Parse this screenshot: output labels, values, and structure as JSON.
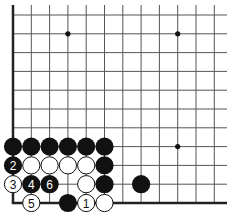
{
  "diagram": {
    "type": "go-board-fragment",
    "corner": "bottom-left",
    "grid": {
      "origin_x": 13,
      "origin_y": 15,
      "spacing_x": 18.3,
      "spacing_y": 18.8,
      "cols": 12,
      "rows": 11,
      "line_extend_right": 227,
      "line_extend_top": 5
    },
    "colors": {
      "black": "#111111",
      "white": "#ffffff",
      "line": "#555555",
      "edge": "#222222"
    },
    "star_points": [
      {
        "col": 3,
        "row": 1
      },
      {
        "col": 9,
        "row": 1
      },
      {
        "col": 9,
        "row": 7
      }
    ],
    "stones": [
      {
        "col": 0,
        "row": 7,
        "color": "black",
        "label": ""
      },
      {
        "col": 1,
        "row": 7,
        "color": "black",
        "label": ""
      },
      {
        "col": 2,
        "row": 7,
        "color": "black",
        "label": ""
      },
      {
        "col": 3,
        "row": 7,
        "color": "black",
        "label": ""
      },
      {
        "col": 4,
        "row": 7,
        "color": "black",
        "label": ""
      },
      {
        "col": 5,
        "row": 7,
        "color": "black",
        "label": ""
      },
      {
        "col": 0,
        "row": 8,
        "color": "black",
        "label": "2"
      },
      {
        "col": 1,
        "row": 8,
        "color": "white",
        "label": ""
      },
      {
        "col": 2,
        "row": 8,
        "color": "white",
        "label": ""
      },
      {
        "col": 3,
        "row": 8,
        "color": "white",
        "label": ""
      },
      {
        "col": 4,
        "row": 8,
        "color": "white",
        "label": ""
      },
      {
        "col": 5,
        "row": 8,
        "color": "black",
        "label": ""
      },
      {
        "col": 0,
        "row": 9,
        "color": "white",
        "label": "3"
      },
      {
        "col": 1,
        "row": 9,
        "color": "black",
        "label": "4"
      },
      {
        "col": 2,
        "row": 9,
        "color": "black",
        "label": "6"
      },
      {
        "col": 4,
        "row": 9,
        "color": "white",
        "label": ""
      },
      {
        "col": 5,
        "row": 9,
        "color": "black",
        "label": ""
      },
      {
        "col": 7,
        "row": 9,
        "color": "black",
        "label": ""
      },
      {
        "col": 1,
        "row": 10,
        "color": "white",
        "label": "5"
      },
      {
        "col": 3,
        "row": 10,
        "color": "black",
        "label": ""
      },
      {
        "col": 4,
        "row": 10,
        "color": "white",
        "label": "1"
      },
      {
        "col": 5,
        "row": 10,
        "color": "white",
        "label": ""
      }
    ]
  }
}
